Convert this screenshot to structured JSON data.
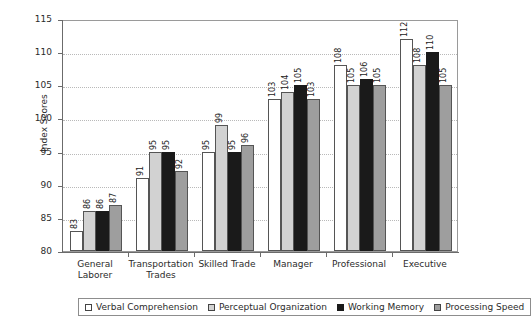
{
  "chart_data": {
    "type": "bar",
    "title": "",
    "xlabel": "",
    "ylabel": "Index Scores",
    "ylim": [
      80,
      115
    ],
    "ytick_step": 5,
    "yticks": [
      80,
      85,
      90,
      95,
      100,
      105,
      110,
      115
    ],
    "grid": true,
    "grid_style": "dotted-horizontal",
    "legend_position": "bottom",
    "bar_labels_shown": true,
    "bar_label_orientation": "vertical",
    "categories": [
      "General Laborer",
      "Transportation Trades",
      "Skilled Trade",
      "Manager",
      "Professional",
      "Executive"
    ],
    "series": [
      {
        "name": "Verbal Comprehension",
        "color": "#ffffff",
        "values": [
          83,
          91,
          95,
          103,
          108,
          112
        ]
      },
      {
        "name": "Perceptual Organization",
        "color": "#d2d2d2",
        "values": [
          86,
          95,
          99,
          104,
          105,
          108
        ]
      },
      {
        "name": "Working Memory",
        "color": "#1a1a1a",
        "values": [
          86,
          95,
          95,
          105,
          106,
          110
        ]
      },
      {
        "name": "Processing Speed",
        "color": "#9e9e9e",
        "values": [
          87,
          92,
          96,
          103,
          105,
          105
        ]
      }
    ]
  },
  "axes": {
    "y_title": "Index Scores",
    "y_tick_labels": [
      "80",
      "85",
      "90",
      "95",
      "100",
      "105",
      "110",
      "115"
    ],
    "x_tick_labels": [
      "General Laborer",
      "Transportation Trades",
      "Skilled Trade",
      "Manager",
      "Professional",
      "Executive"
    ]
  },
  "legend": {
    "items": [
      {
        "label": "Verbal Comprehension",
        "swatch": "white-square"
      },
      {
        "label": "Perceptual Organization",
        "swatch": "light-gray-square"
      },
      {
        "label": "Working Memory",
        "swatch": "black-square"
      },
      {
        "label": "Processing Speed",
        "swatch": "medium-gray-square"
      }
    ]
  }
}
